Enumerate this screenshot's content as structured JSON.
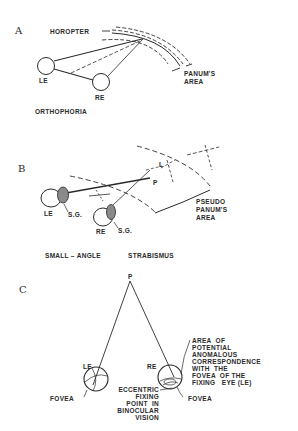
{
  "panels": {
    "a": {
      "letter": "A",
      "horopter": "HOROPTER",
      "panums_area_1": "PANUM'S",
      "panums_area_2": "AREA",
      "le": "LE",
      "re": "RE",
      "caption": "ORTHOPHORIA"
    },
    "b": {
      "letter": "B",
      "le": "LE",
      "re": "RE",
      "sg_left": "S.G.",
      "sg_right": "S.G.",
      "l": "L",
      "p": "P",
      "pseudo_1": "PSEUDO",
      "pseudo_2": "PANUM'S",
      "pseudo_3": "AREA",
      "caption_1": "SMALL – ANGLE",
      "caption_2": "STRABISMUS"
    },
    "c": {
      "letter": "C",
      "p": "P",
      "le": "LE",
      "re": "RE",
      "fovea_left": "FOVEA",
      "fovea_right": "FOVEA",
      "eccentric": [
        "ECCENTRIC",
        "FIXING",
        "POINT  IN",
        "BINOCULAR",
        "VISION"
      ],
      "area": [
        "AREA  OF",
        "POTENTIAL",
        "ANOMALOUS",
        "CORRESPONDENCE",
        "WITH  THE",
        "FOVEA  OF THE",
        "FIXING   EYE (LE)"
      ]
    }
  }
}
